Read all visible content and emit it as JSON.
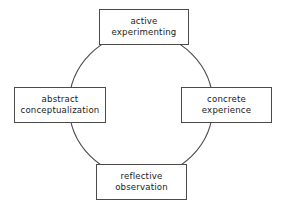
{
  "diagram": {
    "background_color": "#ffffff",
    "stroke_color": "#4a4a4a",
    "text_color": "#1a1a1a",
    "cycle": {
      "shape": "circle",
      "center_x": 141,
      "center_y": 105,
      "radius": 72,
      "direction": "clockwise"
    },
    "nodes": [
      {
        "id": "active-experimenting",
        "position": "top",
        "line1": "active",
        "line2": "experimenting"
      },
      {
        "id": "concrete-experience",
        "position": "right",
        "line1": "concrete",
        "line2": "experience"
      },
      {
        "id": "reflective-observation",
        "position": "bottom",
        "line1": "reflective",
        "line2": "observation"
      },
      {
        "id": "abstract-conceptualization",
        "position": "left",
        "line1": "abstract",
        "line2": "conceptualization"
      }
    ]
  }
}
